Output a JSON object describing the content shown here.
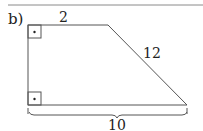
{
  "problem": {
    "label": "b)"
  },
  "figure": {
    "type": "right trapezoid",
    "labels": {
      "top": "2",
      "slant": "12",
      "bottom": "10"
    },
    "colors": {
      "stroke": "#555555",
      "rule": "#888888",
      "text": "#222222"
    }
  }
}
